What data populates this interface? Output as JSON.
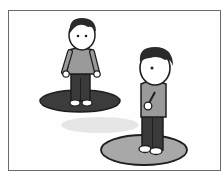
{
  "illustration": {
    "description": "Two cartoon boys standing on circular platforms",
    "colors": {
      "outline": "#1e1e1e",
      "hair": "#2a2a2a",
      "shirt": "#9a9a9a",
      "pants": "#3a3a3a",
      "skin": "#ffffff",
      "platform_back": "#3c3c3c",
      "platform_front": "#a8a8a8",
      "shadow": "#e4e4e4",
      "frame": "#6a6a6a"
    },
    "figures": [
      {
        "name": "back-boy",
        "position": "left-rear",
        "platform": "dark"
      },
      {
        "name": "front-boy",
        "position": "right-front",
        "platform": "light"
      }
    ]
  }
}
